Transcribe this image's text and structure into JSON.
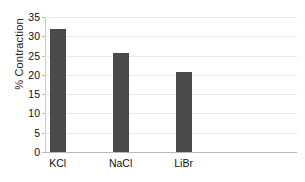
{
  "chart_data": {
    "type": "bar",
    "title": "",
    "subtitle": "",
    "xlabel": "",
    "ylabel": "% Contraction",
    "categories": [
      "KCl",
      "NaCl",
      "LiBr",
      ""
    ],
    "values": [
      32.0,
      25.7,
      20.8,
      null
    ],
    "series": [
      {
        "name": "% Contraction",
        "values": [
          32.0,
          25.7,
          20.8,
          null
        ]
      }
    ],
    "ylim": [
      0,
      35
    ],
    "yticks": [
      0,
      5,
      10,
      15,
      20,
      25,
      30,
      35
    ],
    "ytick_labels": [
      "0",
      "5",
      "10",
      "15",
      "20",
      "25",
      "30",
      "35"
    ],
    "grid": true,
    "grid_axis": "y",
    "legend": false,
    "legend_position": "none",
    "bar_color": "#4a4a4a",
    "gridline_color": "#e9e9e9",
    "axis_color": "#b9b9b9",
    "background_color": "#ffffff",
    "text_color": "#101010",
    "annotations": []
  }
}
